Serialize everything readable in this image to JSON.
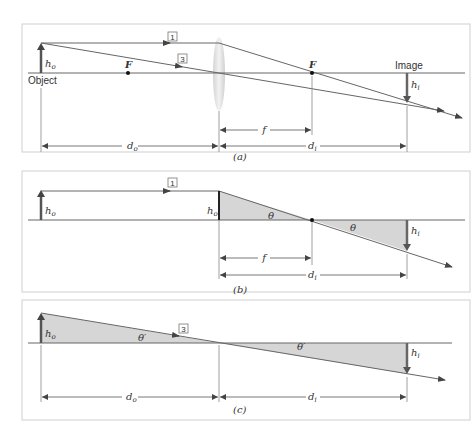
{
  "panels": [
    {
      "id": "a",
      "caption": "(a)",
      "labels": {
        "object": "Object",
        "image": "Image",
        "focal_left": "F",
        "focal_right": "F",
        "ray1": "1",
        "ray3": "3",
        "ho": "h",
        "ho_sub": "o",
        "hi": "h",
        "hi_sub": "i",
        "f": "f",
        "do": "d",
        "do_sub": "o",
        "di": "d",
        "di_sub": "i"
      }
    },
    {
      "id": "b",
      "caption": "(b)",
      "labels": {
        "ray1": "1",
        "ho": "h",
        "ho_sub": "o",
        "ho_lens": "h",
        "ho_lens_sub": "o",
        "theta1": "θ",
        "theta2": "θ",
        "hi": "h",
        "hi_sub": "i",
        "f": "f",
        "di": "d",
        "di_sub": "i"
      }
    },
    {
      "id": "c",
      "caption": "(c)",
      "labels": {
        "ray3": "3",
        "ho": "h",
        "ho_sub": "o",
        "theta1": "θ′",
        "theta2": "θ′",
        "hi": "h",
        "hi_sub": "i",
        "do": "d",
        "do_sub": "o",
        "di": "d",
        "di_sub": "i"
      }
    }
  ],
  "colors": {
    "line": "#555555",
    "arrow": "#444444",
    "shade": "#d6d6d6",
    "frame": "#cfcfcf",
    "lens": "#e2e2e2"
  }
}
